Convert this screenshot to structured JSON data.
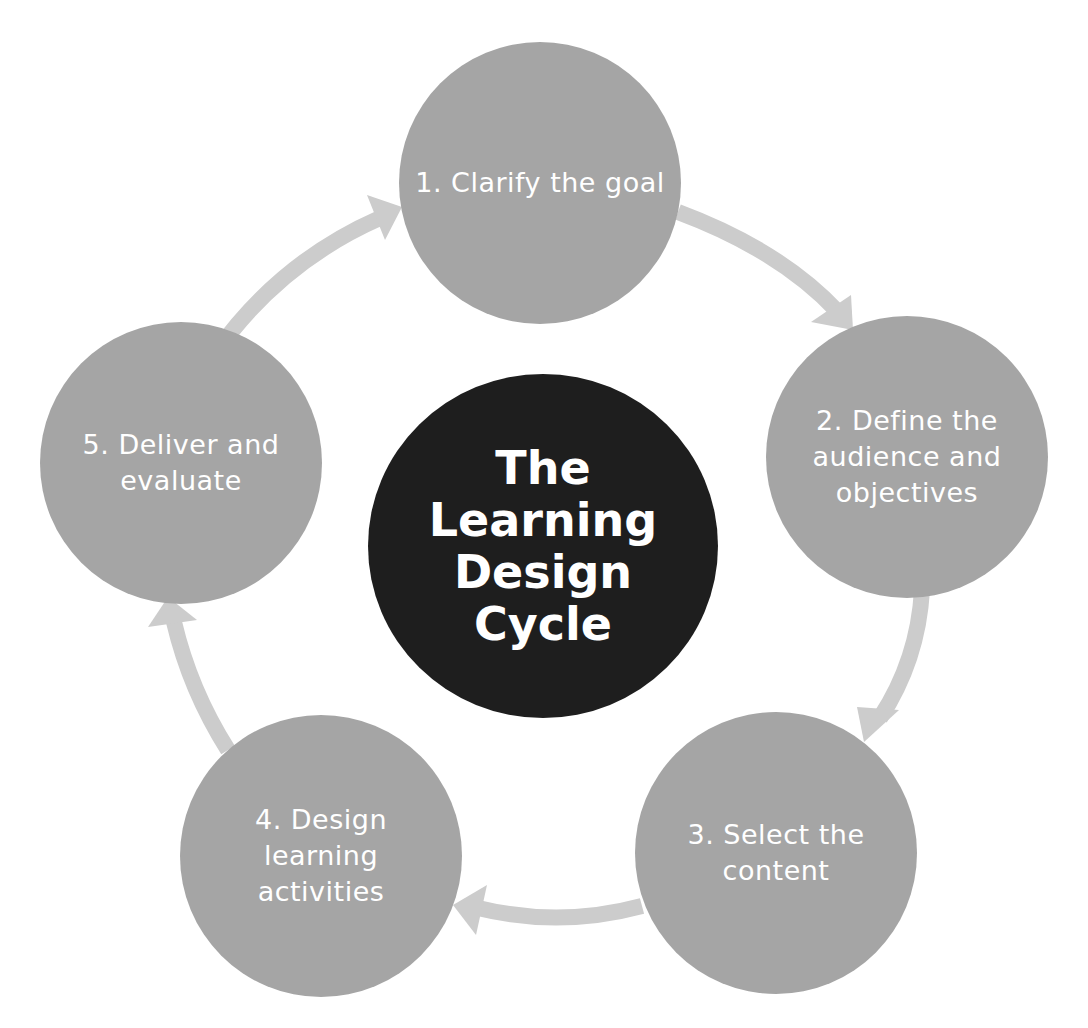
{
  "diagram": {
    "title": "The Learning Design Cycle",
    "title_lines": [
      "The",
      "Learning",
      "Design",
      "Cycle"
    ],
    "steps": [
      {
        "number": 1,
        "label": "1. Clarify the goal"
      },
      {
        "number": 2,
        "label": "2. Define the audience and objectives"
      },
      {
        "number": 3,
        "label": "3. Select the content"
      },
      {
        "number": 4,
        "label": "4. Design learning activities"
      },
      {
        "number": 5,
        "label": "5. Deliver and evaluate"
      }
    ],
    "flow": [
      {
        "from": 1,
        "to": 2
      },
      {
        "from": 2,
        "to": 3
      },
      {
        "from": 3,
        "to": 4
      },
      {
        "from": 4,
        "to": 5
      },
      {
        "from": 5,
        "to": 1
      }
    ],
    "colors": {
      "step_circle": "#a5a5a5",
      "center_circle": "#1e1e1e",
      "arrow": "#cccccc",
      "text": "#ffffff"
    }
  }
}
